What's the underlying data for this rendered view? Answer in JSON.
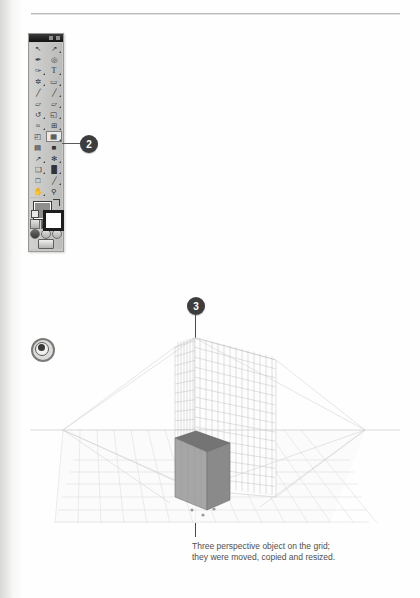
{
  "page": {
    "background": "#fefefe",
    "rule_color": "#b9b9b9"
  },
  "tools_panel": {
    "name": "Tools panel",
    "header": {
      "collapse_icon": "collapse-icon",
      "close_icon": "close-icon"
    },
    "selected_tool": "Perspective Grid Tool",
    "rows": [
      {
        "left": {
          "label": "Selection Tool",
          "glyph": "↖",
          "icon": "selection-arrow-icon",
          "has_flyout": false,
          "selected": false
        },
        "right": {
          "label": "Direct Selection Tool",
          "glyph": "↗",
          "icon": "direct-selection-arrow-icon",
          "has_flyout": true,
          "selected": false
        }
      },
      {
        "left": {
          "label": "Magic Wand Tool",
          "glyph": "✒",
          "icon": "magic-wand-icon",
          "has_flyout": false,
          "selected": false
        },
        "right": {
          "label": "Lasso Tool",
          "glyph": "◎",
          "icon": "lasso-icon",
          "has_flyout": false,
          "selected": false
        }
      },
      {
        "left": {
          "label": "Pen Tool",
          "glyph": "✑",
          "icon": "pen-icon",
          "has_flyout": true,
          "selected": false
        },
        "right": {
          "label": "Type Tool",
          "glyph": "T",
          "icon": "type-icon",
          "has_flyout": true,
          "selected": false
        }
      },
      {
        "left": {
          "label": "Line Segment Tool",
          "glyph": "✲",
          "icon": "line-segment-icon",
          "has_flyout": true,
          "selected": false
        },
        "right": {
          "label": "Rectangle Tool",
          "glyph": "▭",
          "icon": "rectangle-icon",
          "has_flyout": true,
          "selected": false
        }
      },
      {
        "left": {
          "label": "Paintbrush Tool",
          "glyph": "╱",
          "icon": "paintbrush-icon",
          "has_flyout": false,
          "selected": false
        },
        "right": {
          "label": "Pencil Tool",
          "glyph": "╱",
          "icon": "pencil-icon",
          "has_flyout": true,
          "selected": false
        }
      },
      {
        "left": {
          "label": "Blob Brush Tool",
          "glyph": "▱",
          "icon": "blob-brush-icon",
          "has_flyout": false,
          "selected": false
        },
        "right": {
          "label": "Eraser Tool",
          "glyph": "▱",
          "icon": "eraser-icon",
          "has_flyout": true,
          "selected": false
        }
      },
      {
        "left": {
          "label": "Rotate Tool",
          "glyph": "↺",
          "icon": "rotate-icon",
          "has_flyout": true,
          "selected": false
        },
        "right": {
          "label": "Scale Tool",
          "glyph": "◱",
          "icon": "scale-icon",
          "has_flyout": true,
          "selected": false
        }
      },
      {
        "left": {
          "label": "Width Tool",
          "glyph": "≈",
          "icon": "width-icon",
          "has_flyout": true,
          "selected": false
        },
        "right": {
          "label": "Shape Builder Tool",
          "glyph": "⊞",
          "icon": "shape-builder-icon",
          "has_flyout": true,
          "selected": false
        }
      },
      {
        "left": {
          "label": "Free Transform Tool",
          "glyph": "◰",
          "icon": "free-transform-icon",
          "has_flyout": false,
          "selected": false
        },
        "right": {
          "label": "Perspective Grid Tool",
          "glyph": "▦",
          "icon": "perspective-grid-icon",
          "has_flyout": true,
          "selected": true
        }
      },
      {
        "left": {
          "label": "Mesh Tool",
          "glyph": "▤",
          "icon": "mesh-icon",
          "has_flyout": false,
          "selected": false
        },
        "right": {
          "label": "Gradient Tool",
          "glyph": "■",
          "icon": "gradient-icon",
          "has_flyout": false,
          "selected": false
        }
      },
      {
        "left": {
          "label": "Eyedropper Tool",
          "glyph": "↗",
          "icon": "eyedropper-icon",
          "has_flyout": true,
          "selected": false
        },
        "right": {
          "label": "Blend Tool",
          "glyph": "✻",
          "icon": "blend-icon",
          "has_flyout": true,
          "selected": false
        }
      },
      {
        "left": {
          "label": "Symbol Sprayer Tool",
          "glyph": "❑",
          "icon": "symbol-sprayer-icon",
          "has_flyout": true,
          "selected": false
        },
        "right": {
          "label": "Column Graph Tool",
          "glyph": "█",
          "icon": "column-graph-icon",
          "has_flyout": true,
          "selected": false
        }
      },
      {
        "left": {
          "label": "Artboard Tool",
          "glyph": "□",
          "icon": "artboard-icon",
          "has_flyout": false,
          "selected": false
        },
        "right": {
          "label": "Slice Tool",
          "glyph": "╱",
          "icon": "slice-icon",
          "has_flyout": true,
          "selected": false
        }
      },
      {
        "left": {
          "label": "Hand Tool",
          "glyph": "✋",
          "icon": "hand-icon",
          "has_flyout": true,
          "selected": false
        },
        "right": {
          "label": "Zoom Tool",
          "glyph": "⚲",
          "icon": "zoom-magnifier-icon",
          "has_flyout": false,
          "selected": false
        }
      }
    ],
    "swatches": {
      "fill_label": "Fill",
      "fill_color": "#8f8f8d",
      "stroke_label": "Stroke",
      "stroke_color": "#1d1d1d",
      "swap_label": "Swap Fill and Stroke",
      "default_label": "Default Fill and Stroke"
    },
    "bottom_buttons": [
      {
        "label": "Color",
        "icon": "color-icon"
      },
      {
        "label": "Gradient",
        "icon": "gradient-swatch-icon"
      },
      {
        "label": "None",
        "icon": "none-icon"
      },
      {
        "label": "Normal Screen Mode",
        "icon": "screen-mode-icon"
      },
      {
        "label": "Draw Normal",
        "icon": "draw-normal-icon"
      },
      {
        "label": "Draw Behind",
        "icon": "draw-behind-icon"
      }
    ],
    "screen_mode_label": "Change Screen Mode"
  },
  "callouts": [
    {
      "id": "callout-2",
      "number": "2",
      "target": "tools-panel"
    },
    {
      "id": "callout-3",
      "number": "3",
      "target": "perspective-illustration"
    }
  ],
  "perspective_widget": {
    "label": "Plane Switching Widget",
    "icon": "plane-switching-widget-icon"
  },
  "illustration": {
    "label": "Two-point perspective grid with a 3D box",
    "horizon_color": "#c2c2c2",
    "grid_color": "#b5b5b5",
    "ground_grid_color": "#cfcfcf",
    "box": {
      "top_face_color": "#7d7d7d",
      "left_face_color": "#a9a9a9",
      "right_face_color": "#8c8c8c",
      "outline_color": "#6e6e6e"
    },
    "anchor_dots": 3,
    "anchor_dot_color": "#9a9a9a"
  },
  "caption": {
    "line1": "Three perspective object on the grid;",
    "line2": "they were moved, copied and resized."
  }
}
